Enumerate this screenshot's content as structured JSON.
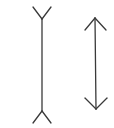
{
  "diagram": {
    "title": "",
    "type": "muller-lyer-illusion",
    "background": "#ffffff",
    "stroke_color": "#3a3a3a",
    "figures": [
      {
        "name": "left-line-fins-out",
        "shaft": {
          "x1": 42,
          "y1": 19,
          "x2": 42,
          "y2": 111
        },
        "top_fins": [
          [
            33,
            7,
            42,
            19
          ],
          [
            51,
            7,
            42,
            19
          ]
        ],
        "bottom_fins": [
          [
            42,
            111,
            33,
            123
          ],
          [
            42,
            111,
            51,
            123
          ]
        ]
      },
      {
        "name": "right-line-arrowheads",
        "shaft": {
          "x1": 95,
          "y1": 18,
          "x2": 96,
          "y2": 109
        },
        "top_fins": [
          [
            85,
            30,
            95,
            18
          ],
          [
            106,
            30,
            95,
            18
          ]
        ],
        "bottom_fins": [
          [
            85,
            98,
            96,
            109
          ],
          [
            107,
            98,
            96,
            109
          ]
        ]
      }
    ]
  }
}
